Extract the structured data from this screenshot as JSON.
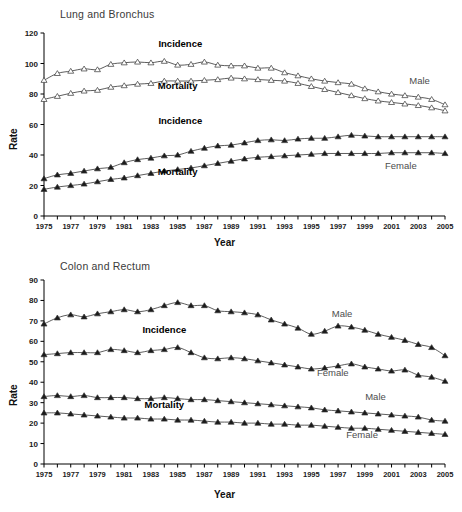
{
  "figure": {
    "axis_label_y": "Rate",
    "axis_label_x": "Year",
    "colors": {
      "line": "#333333",
      "axis": "#000000",
      "title": "#3a3a3a",
      "annotation": "#4d4d4d"
    }
  },
  "panels": [
    {
      "id": "lung",
      "title": "Lung and Bronchus"
    },
    {
      "id": "colon",
      "title": "Colon and Rectum"
    }
  ],
  "annotations": {
    "lung": [
      {
        "text": "Incidence",
        "style": "bold",
        "x": 1985.2,
        "y": 110.5
      },
      {
        "text": "Mortality",
        "style": "bold",
        "x": 1985.0,
        "y": 83.0
      },
      {
        "text": "Male",
        "style": "plain",
        "x": 2003.1,
        "y": 86.5
      },
      {
        "text": "Incidence",
        "style": "bold",
        "x": 1985.2,
        "y": 60.5
      },
      {
        "text": "Mortality",
        "style": "bold",
        "x": 1985.0,
        "y": 27.0
      },
      {
        "text": "Female",
        "style": "plain",
        "x": 2001.7,
        "y": 30.5
      }
    ],
    "colon": [
      {
        "text": "Incidence",
        "style": "bold",
        "x": 1984.0,
        "y": 64.0
      },
      {
        "text": "Mortality",
        "style": "bold",
        "x": 1984.0,
        "y": 27.5
      },
      {
        "text": "Male",
        "style": "plain",
        "x": 1997.3,
        "y": 72.0
      },
      {
        "text": "Female",
        "style": "plain",
        "x": 1996.6,
        "y": 43.0
      },
      {
        "text": "Male",
        "style": "plain",
        "x": 1999.8,
        "y": 31.5
      },
      {
        "text": "Female",
        "style": "plain",
        "x": 1998.8,
        "y": 12.5
      }
    ]
  },
  "chart_data": [
    {
      "type": "line",
      "id": "lung",
      "title": "Lung and Bronchus",
      "xlabel": "Year",
      "ylabel": "Rate",
      "xlim": [
        1975,
        2005
      ],
      "ylim": [
        0,
        120
      ],
      "ytick_step": 20,
      "yticks": [
        0,
        20,
        40,
        60,
        80,
        100,
        120
      ],
      "grid": false,
      "legend": "inline-annotations",
      "x": [
        1975,
        1976,
        1977,
        1978,
        1979,
        1980,
        1981,
        1982,
        1983,
        1984,
        1985,
        1986,
        1987,
        1988,
        1989,
        1990,
        1991,
        1992,
        1993,
        1994,
        1995,
        1996,
        1997,
        1998,
        1999,
        2000,
        2001,
        2002,
        2003,
        2004,
        2005
      ],
      "xtick_labels": [
        "1975",
        "",
        "1977",
        "",
        "1979",
        "",
        "1981",
        "",
        "1983",
        "",
        "1985",
        "",
        "1987",
        "",
        "1989",
        "",
        "1991",
        "",
        "1993",
        "",
        "1995",
        "",
        "1997",
        "",
        "1999",
        "",
        "2001",
        "",
        "2003",
        "",
        "2005"
      ],
      "series": [
        {
          "name": "Male Incidence",
          "sex": "Male",
          "measure": "Incidence",
          "marker": "open-triangle",
          "values": [
            89.0,
            93.5,
            95.0,
            96.5,
            96.0,
            99.5,
            100.5,
            101.0,
            100.5,
            101.5,
            99.0,
            99.5,
            101.0,
            99.0,
            98.5,
            98.5,
            97.0,
            97.0,
            94.0,
            92.0,
            90.0,
            88.5,
            87.5,
            86.5,
            83.5,
            81.5,
            80.0,
            79.0,
            78.0,
            76.5,
            73.0
          ]
        },
        {
          "name": "Male Mortality",
          "sex": "Male",
          "measure": "Mortality",
          "marker": "open-triangle",
          "values": [
            76.5,
            78.5,
            80.5,
            82.0,
            82.5,
            84.5,
            85.5,
            86.5,
            87.0,
            88.5,
            88.5,
            88.5,
            89.0,
            89.5,
            90.5,
            90.0,
            89.5,
            89.0,
            88.5,
            87.0,
            85.0,
            83.0,
            81.0,
            79.0,
            77.0,
            75.5,
            74.5,
            73.5,
            72.5,
            71.0,
            69.0
          ]
        },
        {
          "name": "Female Incidence",
          "sex": "Female",
          "measure": "Incidence",
          "marker": "filled-triangle",
          "values": [
            24.5,
            27.0,
            28.0,
            29.5,
            31.0,
            32.0,
            35.0,
            37.0,
            38.0,
            39.5,
            40.0,
            42.5,
            44.5,
            46.0,
            46.5,
            48.0,
            49.5,
            50.0,
            49.5,
            50.5,
            51.0,
            51.0,
            52.0,
            53.0,
            52.5,
            52.0,
            52.0,
            52.0,
            52.0,
            52.0,
            52.0
          ]
        },
        {
          "name": "Female Mortality",
          "sex": "Female",
          "measure": "Mortality",
          "marker": "filled-triangle",
          "values": [
            17.5,
            19.0,
            20.0,
            21.0,
            22.5,
            24.0,
            25.0,
            26.5,
            28.0,
            29.5,
            30.5,
            31.5,
            33.0,
            34.5,
            36.0,
            37.5,
            38.5,
            39.0,
            39.5,
            40.0,
            40.5,
            41.0,
            41.0,
            41.0,
            41.0,
            41.0,
            41.5,
            41.5,
            41.5,
            41.5,
            41.0
          ]
        }
      ]
    },
    {
      "type": "line",
      "id": "colon",
      "title": "Colon and Rectum",
      "xlabel": "Year",
      "ylabel": "Rate",
      "xlim": [
        1975,
        2005
      ],
      "ylim": [
        0,
        90
      ],
      "ytick_step": 10,
      "yticks": [
        0,
        10,
        20,
        30,
        40,
        50,
        60,
        70,
        80,
        90
      ],
      "grid": false,
      "legend": "inline-annotations",
      "x": [
        1975,
        1976,
        1977,
        1978,
        1979,
        1980,
        1981,
        1982,
        1983,
        1984,
        1985,
        1986,
        1987,
        1988,
        1989,
        1990,
        1991,
        1992,
        1993,
        1994,
        1995,
        1996,
        1997,
        1998,
        1999,
        2000,
        2001,
        2002,
        2003,
        2004,
        2005
      ],
      "xtick_labels": [
        "1975",
        "",
        "1977",
        "",
        "1979",
        "",
        "1981",
        "",
        "1983",
        "",
        "1985",
        "",
        "1987",
        "",
        "1989",
        "",
        "1991",
        "",
        "1993",
        "",
        "1995",
        "",
        "1997",
        "",
        "1999",
        "",
        "2001",
        "",
        "2003",
        "",
        "2005"
      ],
      "series": [
        {
          "name": "Male Incidence",
          "sex": "Male",
          "measure": "Incidence",
          "marker": "filled-triangle",
          "values": [
            68.5,
            71.5,
            73.0,
            72.0,
            73.5,
            74.5,
            75.5,
            74.5,
            75.5,
            77.5,
            79.0,
            77.5,
            77.5,
            75.0,
            74.5,
            74.0,
            73.0,
            70.5,
            68.5,
            66.5,
            63.5,
            65.0,
            67.5,
            67.0,
            65.5,
            63.5,
            62.0,
            60.5,
            58.5,
            57.0,
            53.0
          ]
        },
        {
          "name": "Female Incidence",
          "sex": "Female",
          "measure": "Incidence",
          "marker": "filled-triangle",
          "values": [
            53.5,
            54.0,
            54.5,
            54.5,
            54.5,
            56.0,
            55.5,
            54.5,
            55.5,
            56.0,
            57.0,
            54.5,
            52.0,
            51.5,
            52.0,
            51.5,
            50.5,
            49.5,
            48.5,
            47.5,
            46.5,
            47.0,
            48.0,
            49.0,
            47.5,
            46.5,
            45.5,
            46.0,
            43.5,
            42.5,
            40.5
          ]
        },
        {
          "name": "Male Mortality",
          "sex": "Male",
          "measure": "Mortality",
          "marker": "filled-triangle",
          "values": [
            33.0,
            33.5,
            33.0,
            33.5,
            32.5,
            32.5,
            32.5,
            32.0,
            32.0,
            32.5,
            32.0,
            31.5,
            31.5,
            31.0,
            30.5,
            30.0,
            29.5,
            29.0,
            28.5,
            28.0,
            27.5,
            26.5,
            26.0,
            25.5,
            25.0,
            24.5,
            24.0,
            23.5,
            23.0,
            21.5,
            21.0
          ]
        },
        {
          "name": "Female Mortality",
          "sex": "Female",
          "measure": "Mortality",
          "marker": "filled-triangle",
          "values": [
            25.0,
            25.0,
            24.5,
            24.0,
            23.5,
            23.0,
            22.5,
            22.5,
            22.0,
            22.0,
            21.5,
            21.5,
            21.0,
            20.5,
            20.5,
            20.0,
            20.0,
            19.5,
            19.5,
            19.0,
            19.0,
            18.5,
            18.0,
            17.5,
            17.5,
            17.0,
            16.5,
            16.0,
            15.5,
            15.0,
            14.5
          ]
        }
      ]
    }
  ]
}
